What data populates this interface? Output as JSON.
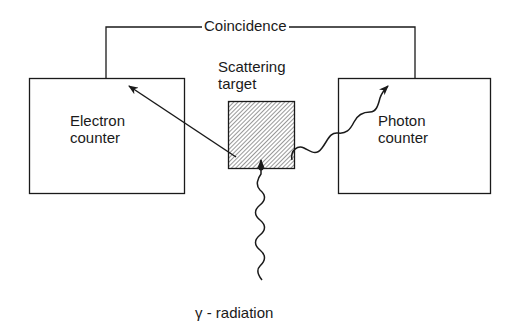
{
  "diagram": {
    "type": "Compton scattering coincidence experiment",
    "labels": {
      "coincidence": "Coincidence",
      "scattering_target_line1": "Scattering",
      "scattering_target_line2": "target",
      "electron_counter_line1": "Electron",
      "electron_counter_line2": "counter",
      "photon_counter_line1": "Photon",
      "photon_counter_line2": "counter",
      "gamma_radiation": "γ - radiation"
    },
    "nodes": [
      {
        "id": "electron-counter",
        "label": "Electron counter",
        "shape": "rectangle"
      },
      {
        "id": "scattering-target",
        "label": "Scattering target",
        "shape": "hatched-square"
      },
      {
        "id": "photon-counter",
        "label": "Photon counter",
        "shape": "rectangle"
      }
    ],
    "edges": [
      {
        "from": "electron-counter",
        "to": "photon-counter",
        "label": "Coincidence",
        "style": "line"
      },
      {
        "from": "gamma-source",
        "to": "scattering-target",
        "label": "γ - radiation",
        "style": "wavy-arrow"
      },
      {
        "from": "scattering-target",
        "to": "electron-counter",
        "label": "electron",
        "style": "straight-arrow"
      },
      {
        "from": "scattering-target",
        "to": "photon-counter",
        "label": "photon",
        "style": "wavy-arrow"
      }
    ],
    "colors": {
      "line": "#1a1a1a",
      "background": "#ffffff"
    }
  }
}
